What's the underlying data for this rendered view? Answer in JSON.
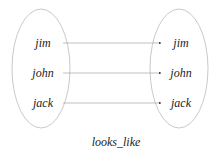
{
  "diagram": {
    "caption": "looks_like",
    "left_set": [
      "jim",
      "john",
      "jack"
    ],
    "right_set": [
      "jim",
      "john",
      "jack"
    ],
    "mappings": [
      {
        "from": "jim",
        "to": "jim"
      },
      {
        "from": "john",
        "to": "john"
      },
      {
        "from": "jack",
        "to": "jack"
      }
    ]
  }
}
